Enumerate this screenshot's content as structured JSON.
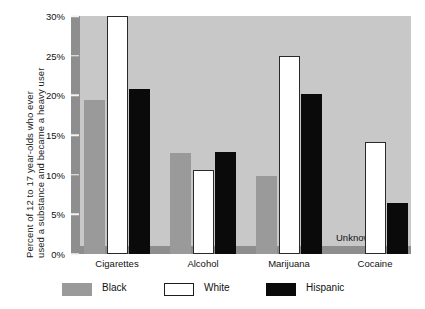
{
  "chart_data": {
    "type": "bar",
    "title": "",
    "xlabel": "",
    "ylabel": "Percent of 12 to 17 year-olds who ever used a substance and became a heavy user",
    "ylabel_line1": "Percent of 12 to 17 year-olds who ever",
    "ylabel_line2": "used a substance and became a heavy user",
    "categories": [
      "Cigarettes",
      "Alcohol",
      "Marijuana",
      "Cocaine"
    ],
    "ylim": [
      0,
      30
    ],
    "yticks": [
      0,
      5,
      10,
      15,
      20,
      25,
      30
    ],
    "ytick_labels": [
      "0%",
      "5%",
      "10%",
      "15%",
      "20%",
      "25%",
      "30%"
    ],
    "grid": false,
    "legend_position": "bottom",
    "series": [
      {
        "name": "Black",
        "color": "#9a9a9a",
        "values": [
          19.4,
          12.7,
          9.8,
          null
        ]
      },
      {
        "name": "White",
        "color": "#ffffff",
        "values": [
          30.0,
          10.6,
          24.9,
          14.1
        ]
      },
      {
        "name": "Hispanic",
        "color": "#0a0a0a",
        "values": [
          20.8,
          12.8,
          20.2,
          6.4
        ]
      }
    ],
    "annotations": [
      {
        "text": "Unknown",
        "category": "Cocaine",
        "series": "Black"
      }
    ],
    "notes": {
      "white_cigarettes_clipped": "bar reaches top of axis at 30%"
    }
  },
  "legend": {
    "items": [
      {
        "label": "Black",
        "swatch": "black-swatch"
      },
      {
        "label": "White",
        "swatch": "white-swatch"
      },
      {
        "label": "Hispanic",
        "swatch": "hispanic-swatch"
      }
    ]
  },
  "colors": {
    "plot_background": "#c8c8c8",
    "axis_band": "#8e8e8e",
    "page_background": "#ffffff",
    "text": "#111111"
  }
}
